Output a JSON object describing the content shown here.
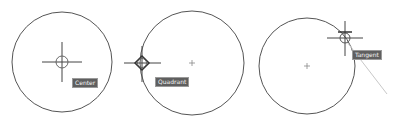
{
  "diagram": {
    "panels": [
      {
        "id": "center",
        "label": "Center"
      },
      {
        "id": "quadrant",
        "label": "Quadrant"
      },
      {
        "id": "tangent",
        "label": "Tangent"
      }
    ]
  },
  "colors": {
    "circle": "#4a4a4a",
    "marker": "#3a3a3a",
    "label_bg": "#5f5f5f",
    "label_text": "#f4f4f4",
    "tangent_line": "#c8c8c8"
  }
}
